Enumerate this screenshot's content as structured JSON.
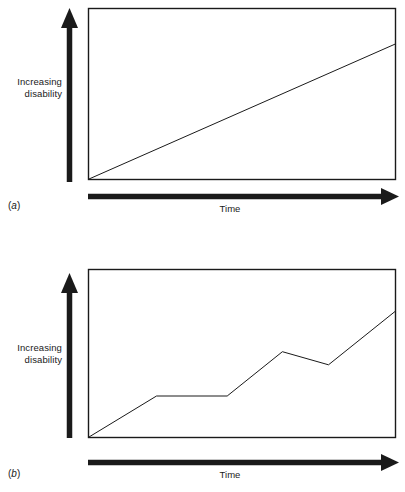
{
  "figure": {
    "kind": "two-panel line diagram",
    "background_color": "#ffffff",
    "ink_color": "#1a1a1a"
  },
  "panels": [
    {
      "tag_open": "(",
      "tag_letter": "a",
      "tag_close": ")",
      "y_axis_label_line1": "Increasing",
      "y_axis_label_line2": "disability",
      "x_axis_label": "Time"
    },
    {
      "tag_open": "(",
      "tag_letter": "b",
      "tag_close": ")",
      "y_axis_label_line1": "Increasing",
      "y_axis_label_line2": "disability",
      "x_axis_label": "Time"
    }
  ],
  "chart_data": [
    {
      "type": "line",
      "title": "(a)",
      "xlabel": "Time",
      "ylabel": "Increasing disability",
      "grid": false,
      "legend": "none",
      "xlim": [
        0,
        100
      ],
      "ylim": [
        0,
        100
      ],
      "axis_ticks": "none",
      "description": "Steady, continuously progressive increase in disability over time",
      "series": [
        {
          "name": "progressive disability",
          "x": [
            0,
            100
          ],
          "y": [
            0,
            81
          ]
        }
      ]
    },
    {
      "type": "line",
      "title": "(b)",
      "xlabel": "Time",
      "ylabel": "Increasing disability",
      "grid": false,
      "legend": "none",
      "xlim": [
        0,
        100
      ],
      "ylim": [
        0,
        100
      ],
      "axis_ticks": "none",
      "description": "Stepwise relapsing-remitting progression: rise, plateau, rise to a peak, partial recovery, then further rise",
      "series": [
        {
          "name": "stepwise disability",
          "x": [
            0,
            22,
            45,
            63,
            78,
            100
          ],
          "y": [
            0,
            25,
            25,
            52,
            44,
            77
          ]
        }
      ]
    }
  ]
}
